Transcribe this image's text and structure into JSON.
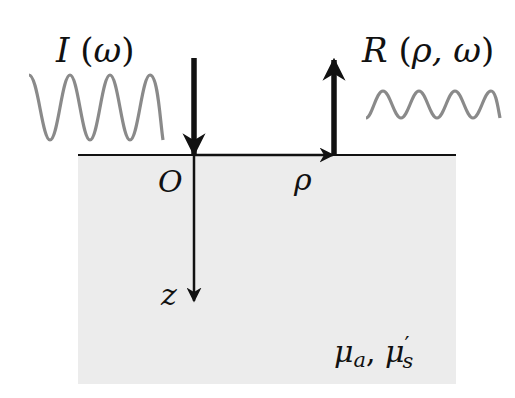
{
  "diagram": {
    "type": "frequency-domain diffuse reflectance geometry",
    "medium": {
      "fill": "#ececec",
      "surface_color": "#111111",
      "properties_label": {
        "mu": "μ",
        "a": "a",
        "sep": ", ",
        "mu2": "μ",
        "prime": "′",
        "s": "s"
      }
    },
    "incident": {
      "label_func": "I",
      "label_open": " (",
      "label_arg": "ω",
      "label_close": ")",
      "wave_color": "#8a8a8a"
    },
    "reflected": {
      "label_func": "R",
      "label_open": " (",
      "label_arg": "ρ, ω",
      "label_close": ")",
      "wave_color": "#8a8a8a"
    },
    "axes": {
      "origin": "O",
      "radial": "ρ",
      "depth": "z"
    },
    "arrow_color": "#111111"
  }
}
